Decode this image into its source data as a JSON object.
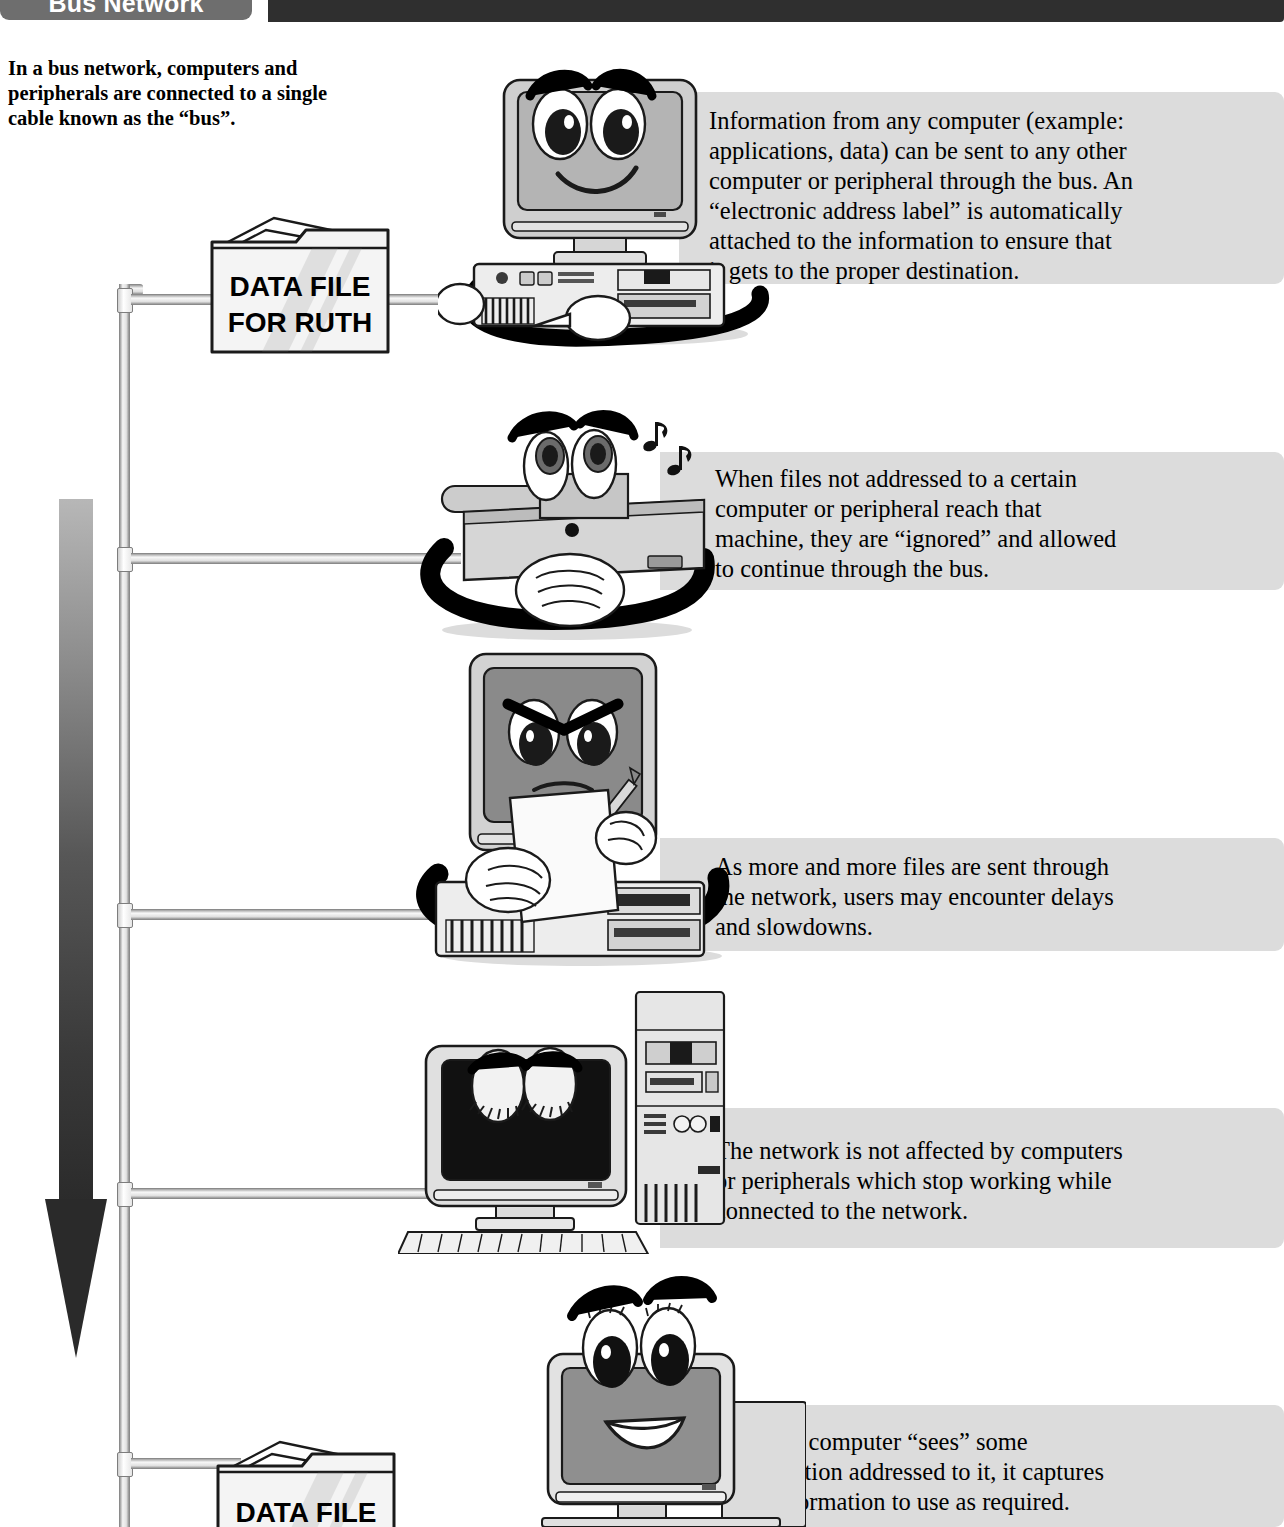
{
  "header": {
    "tab_label": "Bus Network",
    "tab_color": "#6e6e6e",
    "bar_color": "#2f2f2f"
  },
  "intro": {
    "text": "In a bus network, computers and peripherals are connected to a single cable known as the “bus”."
  },
  "panels": [
    {
      "id": "panel-1",
      "text": "Information from any computer (example:\napplications, data) can be sent to any other\ncomputer or peripheral through the bus. An\n“electronic address label” is automatically\n   attached to the information to ensure that\n      it gets to the proper destination."
    },
    {
      "id": "panel-2",
      "text": "When files not addressed to a certain\n   computer or peripheral reach that\n   machine, they are “ignored” and allowed\n   to continue through the bus."
    },
    {
      "id": "panel-3",
      "text": "As more and more files are sent through\n   the network, users may encounter delays\n   and slowdowns."
    },
    {
      "id": "panel-4",
      "text": "The network is not affected by computers\nor peripherals which stop working while\nconnected to the network."
    },
    {
      "id": "panel-5",
      "text": "When a computer “sees” some\n   information addressed to it, it captures\n      that information to use as required."
    }
  ],
  "folders": [
    {
      "id": "folder-top",
      "label": "DATA FILE\nFOR  RUTH"
    },
    {
      "id": "folder-bottom",
      "label": "DATA FILE"
    }
  ],
  "illustrations": [
    {
      "id": "computer-sender",
      "name": "smiling-computer-pointing"
    },
    {
      "id": "printer-ignoring",
      "name": "printer-whistling-ignoring"
    },
    {
      "id": "computer-busy",
      "name": "frowning-computer-reading-paper"
    },
    {
      "id": "computer-asleep",
      "name": "sleeping-computer-with-tower"
    },
    {
      "id": "computer-receiver",
      "name": "happy-computer-receiving"
    }
  ],
  "bus": {
    "arrow_label": "flow-direction-down",
    "connector_count": 5
  }
}
